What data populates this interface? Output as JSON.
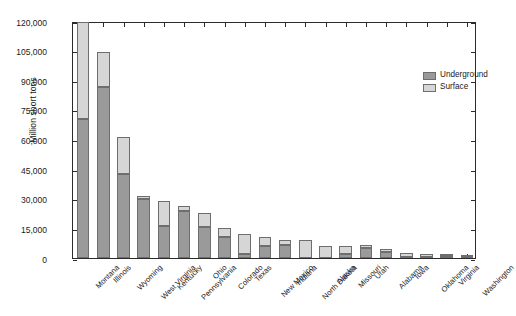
{
  "chart_data": {
    "type": "bar",
    "subtype": "stacked-vertical",
    "title": "",
    "xlabel": "",
    "ylabel": "Million short tons",
    "ylim": [
      0,
      120000
    ],
    "yticks": [
      0,
      15000,
      30000,
      45000,
      60000,
      75000,
      90000,
      105000,
      120000
    ],
    "ytick_labels": [
      "0",
      "15,000",
      "30,000",
      "45,000",
      "60,000",
      "75,000",
      "90,000",
      "105,000",
      "120,000"
    ],
    "grid": false,
    "legend_position": "top-right",
    "categories": [
      "Montana",
      "Illinois",
      "Wyoming",
      "West Virginia",
      "Kentucky",
      "Pennsylvania",
      "Ohio",
      "Colorado",
      "Texas",
      "New Mexico",
      "Indiana",
      "North Dakota",
      "Alaska",
      "Missouri",
      "Utah",
      "Alabama",
      "Iowa",
      "Oklahoma",
      "Virginia",
      "Washington"
    ],
    "series": [
      {
        "name": "Underground",
        "color": "#9a9a9a",
        "values": [
          70500,
          86800,
          42500,
          30000,
          16200,
          23800,
          15500,
          10500,
          2000,
          6200,
          6500,
          0,
          0,
          1800,
          5300,
          2800,
          700,
          400,
          1100,
          300
        ]
      },
      {
        "name": "Surface",
        "color": "#d6d6d6",
        "values": [
          49000,
          17700,
          18600,
          1500,
          12800,
          2700,
          7300,
          4700,
          10300,
          4300,
          2800,
          9000,
          6000,
          4400,
          1300,
          1900,
          1700,
          1600,
          400,
          700
        ]
      }
    ],
    "totals": [
      119500,
      104500,
      61100,
      31500,
      29000,
      26500,
      22800,
      15200,
      12300,
      10500,
      9300,
      9000,
      6000,
      6200,
      6600,
      4700,
      2400,
      2000,
      1500,
      1000
    ]
  },
  "legend": {
    "items": [
      {
        "label": "Underground",
        "color": "#9a9a9a"
      },
      {
        "label": "Surface",
        "color": "#d6d6d6"
      }
    ]
  },
  "axes": {
    "y_title": "Million short tons"
  }
}
